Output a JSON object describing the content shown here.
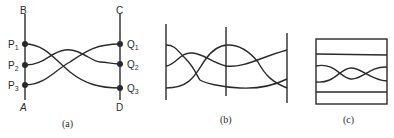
{
  "figure": {
    "panels": [
      {
        "id": "a",
        "caption": "(a)",
        "labels": {
          "top_left": "B",
          "top_right": "C",
          "bottom_left": "A",
          "bottom_right": "D",
          "left_points": [
            {
              "name": "P",
              "sub": "1"
            },
            {
              "name": "P",
              "sub": "2"
            },
            {
              "name": "P",
              "sub": "3"
            }
          ],
          "right_points": [
            {
              "name": "Q",
              "sub": "1"
            },
            {
              "name": "Q",
              "sub": "2"
            },
            {
              "name": "Q",
              "sub": "3"
            }
          ]
        }
      },
      {
        "id": "b",
        "caption": "(b)"
      },
      {
        "id": "c",
        "caption": "(c)"
      }
    ]
  }
}
